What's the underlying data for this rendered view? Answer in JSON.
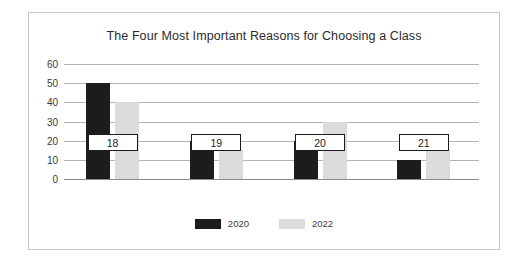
{
  "chart_data": {
    "type": "bar",
    "title": "The Four Most Important Reasons for Choosing a Class",
    "xlabel": "",
    "ylabel": "%",
    "categories": [
      "18",
      "19",
      "20",
      "21"
    ],
    "series": [
      {
        "name": "2020",
        "color": "#1c1c1c",
        "values": [
          50,
          20,
          20,
          10
        ]
      },
      {
        "name": "2022",
        "color": "#dcdcdc",
        "values": [
          40,
          15,
          30,
          15
        ]
      }
    ],
    "ylim": [
      0,
      60
    ],
    "yticks": [
      60,
      50,
      40,
      30,
      20,
      10,
      0
    ],
    "grid": true,
    "legend_position": "bottom"
  },
  "legend": {
    "items": [
      {
        "label": "2020"
      },
      {
        "label": "2022"
      }
    ]
  }
}
